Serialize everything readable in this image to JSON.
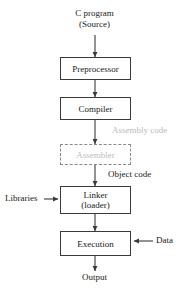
{
  "diagram": {
    "background_color": "#ffffff",
    "line_color": "#3a3a3a",
    "dim_color": "#bcbcbc"
  },
  "source_label": {
    "line1": "C program",
    "line2": "(Source)"
  },
  "nodes": {
    "preprocessor": {
      "label": "Preprocessor"
    },
    "compiler": {
      "label": "Compiler"
    },
    "assembler": {
      "label": "Assembler",
      "state": "dimmed"
    },
    "linker": {
      "line1": "Linker",
      "line2": "(loader)"
    },
    "execution": {
      "label": "Execution"
    }
  },
  "edge_labels": {
    "assembly_code": "Assembly code",
    "object_code": "Object code",
    "libraries": "Libraries",
    "data": "Data",
    "output": "Output"
  }
}
